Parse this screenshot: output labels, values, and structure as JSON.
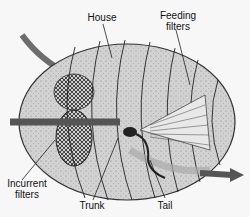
{
  "labels": {
    "house": "House",
    "feeding_filters_1": "Feeding",
    "feeding_filters_2": "filters",
    "incurrent_filters_1": "Incurrent",
    "incurrent_filters_2": "filters",
    "trunk": "Trunk",
    "tail": "Tail"
  },
  "colors": {
    "house_fill": "#d4d4d4",
    "outline": "#222222",
    "arrow": "#555555",
    "mesh": "#333333"
  }
}
